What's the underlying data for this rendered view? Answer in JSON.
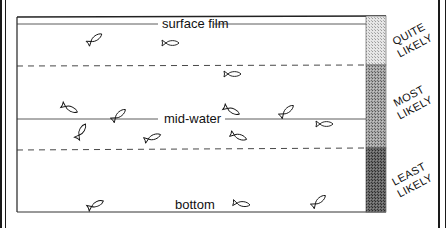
{
  "diagram": {
    "zones": [
      {
        "id": "surface",
        "label": "surface film",
        "likelihood": "QUITE LIKELY",
        "likelihood_lines": [
          "QUITE",
          "LIKELY"
        ],
        "shade": "#d9d9d9"
      },
      {
        "id": "mid",
        "label": "mid-water",
        "likelihood": "MOST LIKELY",
        "likelihood_lines": [
          "MOST",
          "LIKELY"
        ],
        "shade": "#9a9a9a"
      },
      {
        "id": "bottom",
        "label": "bottom",
        "likelihood": "LEAST LIKELY",
        "likelihood_lines": [
          "LEAST",
          "LIKELY"
        ],
        "shade": "#5e5e5e"
      }
    ],
    "fish_count": {
      "surface": 2,
      "mid": 9,
      "bottom": 3
    },
    "fish": [
      {
        "x": 96,
        "y": 38,
        "angle": -35,
        "zone": "surface"
      },
      {
        "x": 172,
        "y": 43,
        "angle": 0,
        "zone": "surface"
      },
      {
        "x": 234,
        "y": 74,
        "angle": 0,
        "zone": "mid"
      },
      {
        "x": 71,
        "y": 109,
        "angle": 25,
        "zone": "mid"
      },
      {
        "x": 120,
        "y": 114,
        "angle": -40,
        "zone": "mid"
      },
      {
        "x": 233,
        "y": 111,
        "angle": 25,
        "zone": "mid"
      },
      {
        "x": 288,
        "y": 110,
        "angle": -40,
        "zone": "mid"
      },
      {
        "x": 82,
        "y": 130,
        "angle": -60,
        "zone": "mid"
      },
      {
        "x": 154,
        "y": 137,
        "angle": -20,
        "zone": "mid"
      },
      {
        "x": 240,
        "y": 137,
        "angle": 20,
        "zone": "mid"
      },
      {
        "x": 326,
        "y": 124,
        "angle": 0,
        "zone": "mid"
      },
      {
        "x": 97,
        "y": 204,
        "angle": -25,
        "zone": "bottom"
      },
      {
        "x": 243,
        "y": 204,
        "angle": 8,
        "zone": "bottom"
      },
      {
        "x": 320,
        "y": 200,
        "angle": -40,
        "zone": "bottom"
      }
    ]
  }
}
